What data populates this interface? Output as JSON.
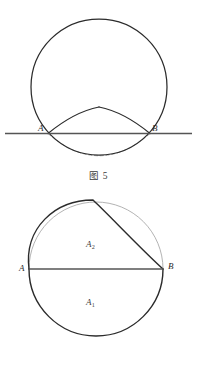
{
  "page": {
    "background_color": "#ffffff",
    "width": 197,
    "height": 377,
    "stroke_color": "#2b2b2b",
    "faint_stroke_color": "#9a9a9a",
    "text_color": "#2b2b2b"
  },
  "figure5": {
    "caption": "图 5",
    "labels": {
      "point_a": "A",
      "point_b": "B"
    },
    "geometry": {
      "circle": {
        "cx": 99,
        "cy": 87,
        "r": 68
      },
      "baseline": {
        "x1": 5,
        "y1": 133.5,
        "x2": 192,
        "y2": 133.5
      },
      "point_a": {
        "x": 48,
        "y": 133.5
      },
      "point_b": {
        "x": 150,
        "y": 133.5
      },
      "left_arc_peak": {
        "x": 99,
        "y": 107
      },
      "dashed_arc_bottom": {
        "x": 99,
        "y": 156
      }
    }
  },
  "figure6": {
    "caption": "图 6",
    "labels": {
      "point_a": "A",
      "point_b": "B",
      "region_upper": "A",
      "region_upper_sub": "2",
      "region_lower": "A",
      "region_lower_sub": "1"
    },
    "geometry": {
      "circle": {
        "cx": 96,
        "cy": 269,
        "r": 67
      },
      "chord": {
        "x1": 29,
        "y1": 269,
        "x2": 163,
        "y2": 269
      },
      "point_a": {
        "x": 29,
        "y": 269
      },
      "point_b": {
        "x": 163,
        "y": 269
      },
      "bold_upper_curve_peak": {
        "x": 93,
        "y": 200
      }
    }
  }
}
